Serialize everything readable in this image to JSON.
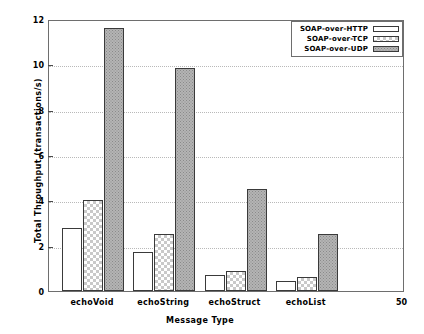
{
  "chart_data": {
    "type": "bar",
    "title": "",
    "xlabel": "Message Type",
    "ylabel": "Total Throughput (transactions/s)",
    "categories": [
      "echoVoid",
      "echoString",
      "echoStruct",
      "echoList"
    ],
    "series": [
      {
        "name": "SOAP-over-HTTP",
        "values": [
          2.8,
          1.7,
          0.72,
          0.45
        ]
      },
      {
        "name": "SOAP-over-TCP",
        "values": [
          4.0,
          2.5,
          0.9,
          0.6
        ]
      },
      {
        "name": "SOAP-over-UDP",
        "values": [
          11.6,
          9.85,
          4.5,
          2.5
        ]
      }
    ],
    "ylim": [
      0,
      12
    ],
    "yticks": [
      0,
      2,
      4,
      6,
      8,
      10,
      12
    ],
    "ytick_labels": [
      "0",
      "2",
      "4",
      "6",
      "8",
      "10",
      "12"
    ],
    "grid": true,
    "legend_position": "top-right",
    "annotations": [
      "50"
    ]
  },
  "legend": {
    "entries": [
      {
        "label": "SOAP-over-HTTP"
      },
      {
        "label": "SOAP-over-TCP"
      },
      {
        "label": "SOAP-over-UDP"
      }
    ]
  }
}
